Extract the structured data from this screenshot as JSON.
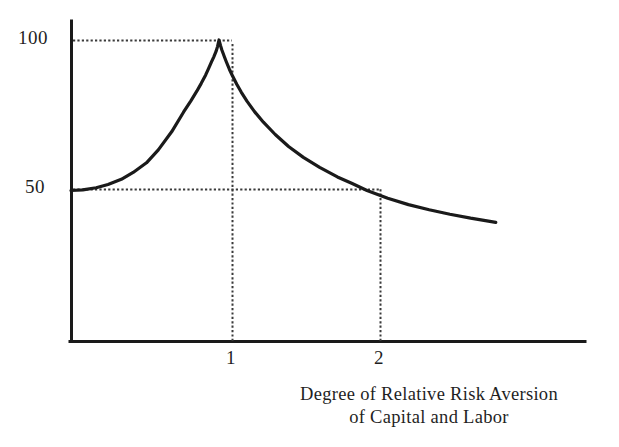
{
  "chart_data": {
    "type": "line",
    "title": "",
    "subtitle": "",
    "xlabel_line1": "Degree of Relative Risk Aversion",
    "xlabel_line2": "of Capital and Labor",
    "ylabel": "",
    "xticks": [
      "1",
      "2"
    ],
    "xtick_values": [
      1,
      2
    ],
    "yticks": [
      "100",
      "50"
    ],
    "ytick_values": [
      100,
      50
    ],
    "xlim": [
      0,
      3.47
    ],
    "ylim": [
      0,
      107
    ],
    "grid": false,
    "legend": null,
    "annotations": [
      {
        "type": "dotted-horizontal",
        "y": 100,
        "x_from": 0,
        "x_to": 1
      },
      {
        "type": "dotted-horizontal",
        "y": 50,
        "x_from": 0,
        "x_to": 2
      },
      {
        "type": "dotted-vertical",
        "x": 1,
        "y_from": 0,
        "y_to": 100
      },
      {
        "type": "dotted-vertical",
        "x": 2,
        "y_from": 0,
        "y_to": 50
      }
    ],
    "series": [
      {
        "name": "Share",
        "color": "#1a1a1a",
        "x": [
          0.0,
          0.08,
          0.17,
          0.25,
          0.34,
          0.42,
          0.51,
          0.59,
          0.68,
          0.76,
          0.81,
          0.85,
          0.88,
          0.91,
          0.93,
          0.95,
          0.965,
          0.98,
          0.99,
          1.0,
          1.01,
          1.02,
          1.035,
          1.05,
          1.07,
          1.09,
          1.12,
          1.15,
          1.19,
          1.24,
          1.3,
          1.38,
          1.47,
          1.57,
          1.68,
          1.8,
          1.9,
          2.0,
          2.14,
          2.28,
          2.42,
          2.56,
          2.7,
          2.86,
          2.87
        ],
        "y": [
          50.0,
          50.2,
          50.9,
          52.0,
          53.7,
          56.0,
          59.2,
          63.5,
          69.5,
          76.0,
          79.8,
          83.0,
          85.6,
          88.4,
          90.6,
          92.8,
          94.4,
          96.2,
          97.8,
          100.0,
          98.2,
          96.6,
          94.6,
          92.7,
          90.3,
          88.2,
          85.3,
          82.7,
          79.6,
          76.2,
          72.7,
          68.6,
          64.6,
          61.0,
          57.7,
          54.5,
          52.3,
          50.0,
          47.4,
          45.3,
          43.6,
          42.1,
          40.8,
          39.5,
          39.4
        ]
      }
    ]
  },
  "axes": {
    "yaxis_name": "vertical-axis",
    "xaxis_name": "horizontal-axis"
  }
}
